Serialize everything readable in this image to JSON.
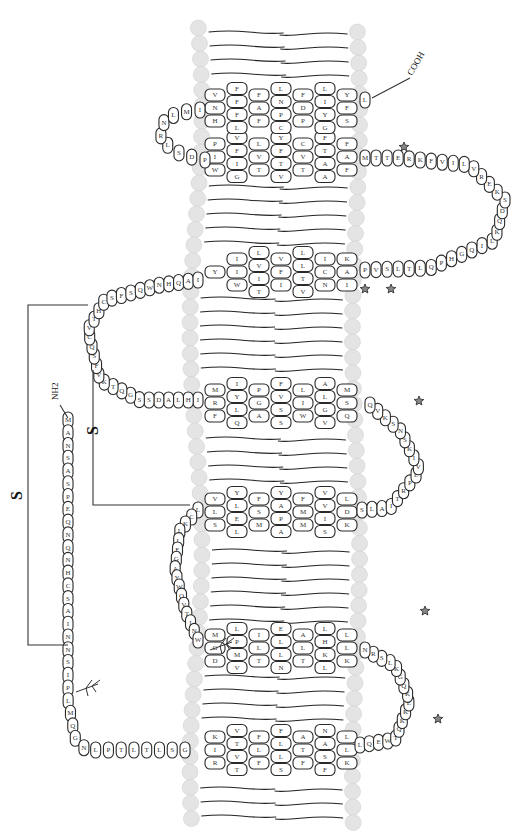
{
  "figure": {
    "type": "GPCR snake plot (rotated 90°, extracellular left, intracellular right)",
    "termini": {
      "n_terminus": "NH2",
      "c_terminus": "COOH"
    },
    "disulfide_label": "S",
    "n_terminal_tail": [
      "M",
      "A",
      "N",
      "S",
      "A",
      "S",
      "P",
      "E",
      "Q",
      "N",
      "Q",
      "N",
      "H",
      "C",
      "S",
      "A",
      "I",
      "N",
      "N",
      "S",
      "I",
      "P",
      "L",
      "M",
      "Q",
      "G",
      "N",
      "L",
      "P",
      "T",
      "L",
      "T",
      "L",
      "S",
      "G"
    ],
    "helices": [
      {
        "id": "TM1",
        "rows": [
          [
            "K",
            "I",
            "R"
          ],
          [
            "V",
            "T",
            "V",
            "T"
          ],
          [
            "F",
            "L",
            "F"
          ],
          [
            "F",
            "L",
            "L",
            "S"
          ],
          [
            "A",
            "T",
            "F"
          ],
          [
            "N",
            "A",
            "S",
            "F"
          ],
          [
            "L",
            "L",
            "K"
          ]
        ]
      },
      {
        "id": "TM2",
        "rows": [
          [
            "M",
            "G",
            "D"
          ],
          [
            "L",
            "P",
            "M",
            "V"
          ],
          [
            "I",
            "L",
            "T"
          ],
          [
            "E",
            "L",
            "L",
            "N"
          ],
          [
            "A",
            "L",
            "T"
          ],
          [
            "L",
            "H",
            "K",
            "L"
          ],
          [
            "L",
            "L",
            "K"
          ]
        ]
      },
      {
        "id": "TM3",
        "rows": [
          [
            "V",
            "L",
            "S"
          ],
          [
            "Y",
            "L",
            "E",
            "L"
          ],
          [
            "F",
            "S",
            "M"
          ],
          [
            "Y",
            "A",
            "P",
            "A"
          ],
          [
            "F",
            "M",
            "M"
          ],
          [
            "V",
            "V",
            "I",
            "S"
          ],
          [
            "L",
            "D",
            "K"
          ]
        ]
      },
      {
        "id": "TM4",
        "rows": [
          [
            "M",
            "R",
            "F"
          ],
          [
            "I",
            "Y",
            "L",
            "Q"
          ],
          [
            "P",
            "G",
            "A"
          ],
          [
            "F",
            "V",
            "S",
            "S"
          ],
          [
            "L",
            "I",
            "W"
          ],
          [
            "A",
            "L",
            "G",
            "V"
          ],
          [
            "M",
            "S",
            "Q"
          ]
        ]
      },
      {
        "id": "TM5",
        "rows": [
          [
            "Y"
          ],
          [
            "I",
            "I",
            "W"
          ],
          [
            "L",
            "V",
            "I",
            "T"
          ],
          [
            "V",
            "F",
            "I"
          ],
          [
            "L",
            "L",
            "T",
            "V"
          ],
          [
            "I",
            "C",
            "N"
          ],
          [
            "K",
            "A",
            "I"
          ]
        ]
      },
      {
        "id": "TM6",
        "rows": [
          [
            "P",
            "I",
            "W"
          ],
          [
            "V",
            "F",
            "I",
            "G"
          ],
          [
            "L",
            "V",
            "T"
          ],
          [
            "Y",
            "F",
            "T",
            "V"
          ],
          [
            "C",
            "V",
            "T"
          ],
          [
            "F",
            "T",
            "A",
            "A"
          ],
          [
            "F",
            "A",
            "F"
          ]
        ]
      },
      {
        "id": "TM7",
        "rows": [
          [
            "V",
            "N",
            "H"
          ],
          [
            "F",
            "F",
            "F",
            "L"
          ],
          [
            "F",
            "A",
            "F"
          ],
          [
            "L",
            "N",
            "P",
            "C"
          ],
          [
            "F",
            "D",
            "P"
          ],
          [
            "L",
            "I",
            "Y",
            "G"
          ],
          [
            "Y",
            "F",
            "S"
          ]
        ]
      }
    ],
    "extracellular_loops": [
      {
        "id": "ECL1",
        "residues": [
          "L",
          "C",
          "K",
          "L",
          "L",
          "E",
          "G",
          "A",
          "Y",
          "W",
          "Q",
          "V",
          "T",
          "I",
          "N",
          "W"
        ]
      },
      {
        "id": "ECL2",
        "residues": [
          "I",
          "H",
          "L",
          "A",
          "D",
          "S",
          "S",
          "G",
          "Q",
          "T",
          "K",
          "V",
          "F",
          "S",
          "Q",
          "C",
          "V",
          "T",
          "H",
          "C",
          "S",
          "F",
          "S",
          "Q",
          "W",
          "N",
          "H",
          "Q",
          "A",
          "I"
        ]
      },
      {
        "id": "ECL3",
        "residues": [
          "P",
          "D",
          "S",
          "L",
          "R",
          "N",
          "L",
          "M",
          "I"
        ]
      }
    ],
    "intracellular_loops": [
      {
        "id": "ICL1",
        "residues": [
          "L",
          "Q",
          "E",
          "W",
          "T",
          "Q",
          "K",
          "K",
          "E",
          "K",
          "Q",
          "G",
          "K",
          "L",
          "S",
          "R",
          "N"
        ]
      },
      {
        "id": "ICL2",
        "residues": [
          "S",
          "L",
          "A",
          "I",
          "T",
          "R",
          "P",
          "L",
          "V",
          "I",
          "K",
          "S",
          "N",
          "S",
          "K",
          "V",
          "Q"
        ]
      },
      {
        "id": "ICL3",
        "residues": [
          "P",
          "V",
          "S",
          "L",
          "T",
          "L",
          "Q",
          "P",
          "H",
          "G",
          "Q",
          "I",
          "L",
          "K",
          "Q",
          "D",
          "S",
          "K",
          "E",
          "R",
          "V",
          "L",
          "I",
          "V",
          "F",
          "K",
          "R",
          "E",
          "T",
          "T",
          "M"
        ]
      }
    ],
    "c_terminal_tail": [
      "L"
    ],
    "markers": {
      "phosphorylation_star_count": 6,
      "glycosylation_site_count": 2,
      "disulfide_bridge_count": 2
    }
  }
}
